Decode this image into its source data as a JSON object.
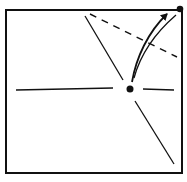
{
  "diagram": {
    "type": "origami-fold-step",
    "colors": {
      "stroke": "#111111",
      "background": "#ffffff"
    },
    "square": {
      "x1": 6,
      "y1": 10,
      "x2": 182,
      "y2": 173
    },
    "center_point": {
      "x": 130,
      "y": 89
    },
    "corner_point": {
      "x": 180,
      "y": 9
    },
    "lines": {
      "horizontal_left": {
        "x1": 16,
        "y1": 90,
        "x2": 113,
        "y2": 88
      },
      "horizontal_right": {
        "x1": 143,
        "y1": 89,
        "x2": 174,
        "y2": 90
      },
      "diagonal_upper": {
        "x1": 85,
        "y1": 16,
        "x2": 123,
        "y2": 80
      },
      "diagonal_lower": {
        "x1": 135,
        "y1": 101,
        "x2": 174,
        "y2": 164
      },
      "dashed_fold": {
        "x1": 90,
        "y1": 14,
        "x2": 177,
        "y2": 57
      }
    },
    "arrows": {
      "fold_arrow": {
        "from": "center_point",
        "to": "corner_point"
      }
    }
  }
}
